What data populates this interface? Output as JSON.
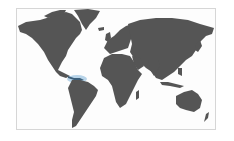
{
  "map": {
    "type": "world-choropleth",
    "land_color": "#555555",
    "highlight_color": "#7fb2d8",
    "background": "#fdfdfd",
    "border_color": "#d6d6d6",
    "highlighted_region": "Panama / Central America isthmus"
  }
}
